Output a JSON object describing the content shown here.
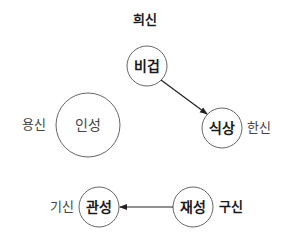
{
  "diagram": {
    "nodes": [
      {
        "id": "bigeop",
        "label": "비겁",
        "role": "희신",
        "cx": 147,
        "cy": 66,
        "r": 20,
        "label_weight": "bold",
        "role_weight": "bold",
        "role_pos": "above"
      },
      {
        "id": "inseong",
        "label": "인성",
        "role": "용신",
        "cx": 88,
        "cy": 125,
        "r": 32,
        "label_weight": "normal",
        "role_weight": "normal",
        "role_pos": "left"
      },
      {
        "id": "siksang",
        "label": "식상",
        "role": "한신",
        "cx": 222,
        "cy": 128,
        "r": 20,
        "label_weight": "bold",
        "role_weight": "normal",
        "role_pos": "right"
      },
      {
        "id": "gwanseong",
        "label": "관성",
        "role": "기신",
        "cx": 99,
        "cy": 207,
        "r": 20,
        "label_weight": "bold",
        "role_weight": "normal",
        "role_pos": "left"
      },
      {
        "id": "jaeseong",
        "label": "재성",
        "role": "구신",
        "cx": 193,
        "cy": 207,
        "r": 20,
        "label_weight": "bold",
        "role_weight": "bold",
        "role_pos": "right"
      }
    ],
    "arrows": [
      {
        "from": "bigeop",
        "to": "siksang"
      },
      {
        "from": "jaeseong",
        "to": "gwanseong"
      }
    ],
    "colors": {
      "stroke": "#555555",
      "arrow": "#222222",
      "text": "#1a1a1a"
    }
  }
}
